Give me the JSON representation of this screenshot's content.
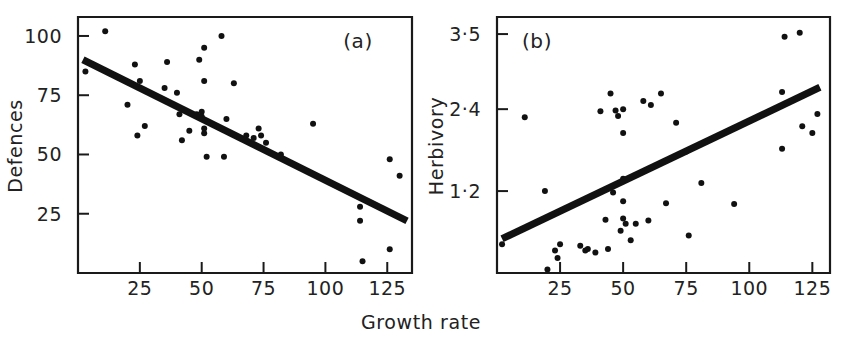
{
  "figure": {
    "shared_xlabel": "Growth rate",
    "background": "#ffffff",
    "ink_color": "#111111"
  },
  "chart_data": [
    {
      "type": "scatter",
      "panel_label": "(a)",
      "title": "",
      "xlabel": "Growth rate",
      "ylabel": "Defences",
      "xlim": [
        0,
        135
      ],
      "ylim": [
        0,
        108
      ],
      "xticks": [
        25,
        50,
        75,
        100,
        125
      ],
      "xticklabels": [
        "25",
        "50",
        "75",
        "100",
        "125"
      ],
      "yticks": [
        25,
        50,
        75,
        100
      ],
      "yticklabels": [
        "25",
        "50",
        "75",
        "100"
      ],
      "grid": false,
      "legend": "none",
      "points": [
        [
          3,
          85
        ],
        [
          11,
          102
        ],
        [
          20,
          71
        ],
        [
          23,
          88
        ],
        [
          24,
          58
        ],
        [
          25,
          81
        ],
        [
          27,
          62
        ],
        [
          35,
          78
        ],
        [
          36,
          89
        ],
        [
          40,
          76
        ],
        [
          41,
          67
        ],
        [
          42,
          56
        ],
        [
          45,
          60
        ],
        [
          48,
          67
        ],
        [
          49,
          90
        ],
        [
          50,
          68
        ],
        [
          50,
          66
        ],
        [
          51,
          95
        ],
        [
          51,
          81
        ],
        [
          51,
          61
        ],
        [
          51,
          59
        ],
        [
          52,
          49
        ],
        [
          58,
          100
        ],
        [
          59,
          49
        ],
        [
          60,
          65
        ],
        [
          63,
          80
        ],
        [
          68,
          58
        ],
        [
          71,
          57
        ],
        [
          73,
          61
        ],
        [
          74,
          58
        ],
        [
          76,
          55
        ],
        [
          82,
          50
        ],
        [
          95,
          63
        ],
        [
          114,
          28
        ],
        [
          114,
          22
        ],
        [
          115,
          5
        ],
        [
          126,
          48
        ],
        [
          126,
          10
        ],
        [
          130,
          41
        ]
      ],
      "fit_line": {
        "x": [
          2,
          133
        ],
        "y": [
          90,
          22
        ],
        "style": "thick solid"
      }
    },
    {
      "type": "scatter",
      "panel_label": "(b)",
      "title": "",
      "xlabel": "Growth rate",
      "ylabel": "Herbivory",
      "xlim": [
        0,
        132
      ],
      "ylim": [
        0,
        3.75
      ],
      "xticks": [
        25,
        50,
        75,
        100,
        125
      ],
      "xticklabels": [
        "25",
        "50",
        "75",
        "100",
        "125"
      ],
      "yticks": [
        1.2,
        2.4,
        3.5
      ],
      "yticklabels": [
        "1·2",
        "2·4",
        "3·5"
      ],
      "grid": false,
      "legend": "none",
      "points": [
        [
          2,
          0.42
        ],
        [
          11,
          2.28
        ],
        [
          19,
          1.2
        ],
        [
          20,
          0.05
        ],
        [
          23,
          0.33
        ],
        [
          24,
          0.22
        ],
        [
          25,
          0.42
        ],
        [
          33,
          0.4
        ],
        [
          35,
          0.33
        ],
        [
          36,
          0.35
        ],
        [
          39,
          0.3
        ],
        [
          41,
          2.37
        ],
        [
          43,
          0.78
        ],
        [
          44,
          0.35
        ],
        [
          45,
          2.63
        ],
        [
          46,
          1.18
        ],
        [
          47,
          2.38
        ],
        [
          48,
          2.3
        ],
        [
          49,
          0.62
        ],
        [
          50,
          2.4
        ],
        [
          50,
          1.38
        ],
        [
          50,
          1.05
        ],
        [
          50,
          0.8
        ],
        [
          50,
          2.05
        ],
        [
          51,
          0.72
        ],
        [
          53,
          0.48
        ],
        [
          55,
          0.72
        ],
        [
          58,
          2.52
        ],
        [
          60,
          0.77
        ],
        [
          61,
          2.46
        ],
        [
          65,
          2.63
        ],
        [
          67,
          1.02
        ],
        [
          71,
          2.2
        ],
        [
          75,
          1.78
        ],
        [
          76,
          0.55
        ],
        [
          81,
          1.32
        ],
        [
          94,
          1.01
        ],
        [
          113,
          2.65
        ],
        [
          113,
          1.82
        ],
        [
          114,
          3.46
        ],
        [
          120,
          3.52
        ],
        [
          121,
          2.15
        ],
        [
          125,
          2.05
        ],
        [
          127,
          2.33
        ]
      ],
      "fit_line": {
        "x": [
          2,
          128
        ],
        "y": [
          0.5,
          2.72
        ],
        "style": "thick solid"
      }
    }
  ]
}
